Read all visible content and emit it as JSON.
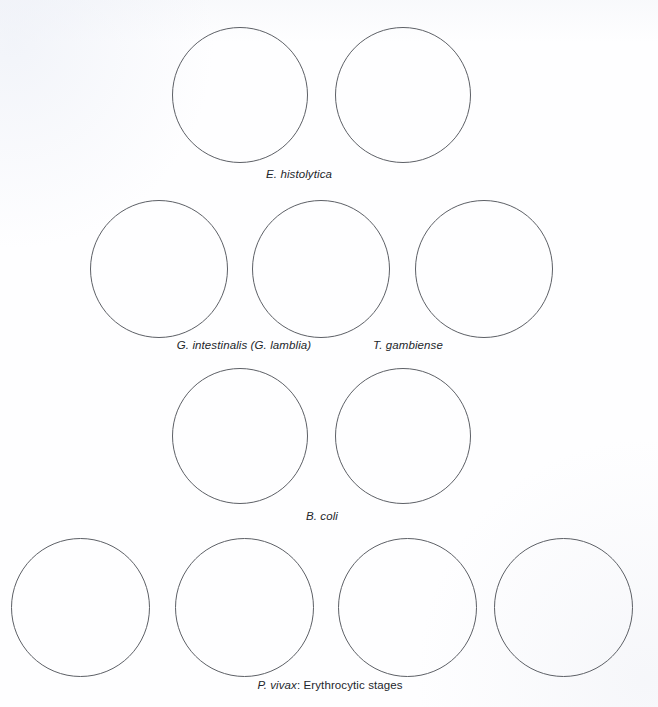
{
  "figure": {
    "background_color": "#ffffff",
    "outline_color": "#5d6066",
    "text_color": "#23262b",
    "width": 658,
    "height": 707
  },
  "rows": [
    {
      "id": "row-e-histolytica",
      "caption": {
        "scientific": "E. histolytica",
        "suffix": "",
        "center_x": 299,
        "top": 168
      },
      "circles": [
        {
          "left": 172,
          "top": 27,
          "size": 136
        },
        {
          "left": 335,
          "top": 27,
          "size": 136
        }
      ]
    },
    {
      "id": "row-g-intestinalis-t-gambiense",
      "captions": [
        {
          "scientific": "G. intestinalis (G. lamblia)",
          "suffix": "",
          "center_x": 244,
          "top": 339
        },
        {
          "scientific": "T. gambiense",
          "suffix": "",
          "center_x": 408,
          "top": 339
        }
      ],
      "circles": [
        {
          "left": 90,
          "top": 200,
          "size": 138
        },
        {
          "left": 252,
          "top": 200,
          "size": 138
        },
        {
          "left": 415,
          "top": 200,
          "size": 138
        }
      ]
    },
    {
      "id": "row-b-coli",
      "caption": {
        "scientific": "B. coli",
        "suffix": "",
        "center_x": 322,
        "top": 510
      },
      "circles": [
        {
          "left": 172,
          "top": 368,
          "size": 136
        },
        {
          "left": 335,
          "top": 368,
          "size": 136
        }
      ]
    },
    {
      "id": "row-p-vivax",
      "caption": {
        "scientific": "P. vivax",
        "suffix": ": Erythrocytic stages",
        "center_x": 330,
        "top": 679
      },
      "circles": [
        {
          "left": 11,
          "top": 538,
          "size": 139
        },
        {
          "left": 175,
          "top": 538,
          "size": 139
        },
        {
          "left": 338,
          "top": 538,
          "size": 139
        },
        {
          "left": 494,
          "top": 538,
          "size": 139
        }
      ]
    }
  ],
  "labels": {
    "e_histolytica": "E. histolytica",
    "g_intestinalis": "G. intestinalis (G. lamblia)",
    "t_gambiense": "T. gambiense",
    "b_coli": "B. coli",
    "p_vivax_sci": "P. vivax",
    "p_vivax_rest": ": Erythrocytic stages"
  }
}
